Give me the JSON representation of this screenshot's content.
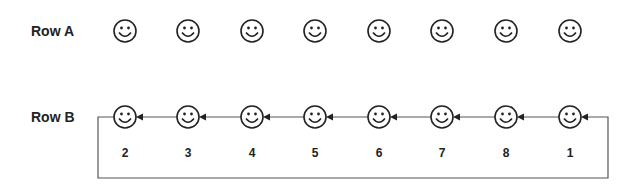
{
  "rows": [
    {
      "label": "Row A",
      "y": 31
    },
    {
      "label": "Row B",
      "y": 117
    }
  ],
  "smiley_x": [
    125,
    188,
    252,
    315,
    379,
    442,
    506,
    570
  ],
  "row_b_numbers": [
    "2",
    "3",
    "4",
    "5",
    "6",
    "7",
    "8",
    "1"
  ],
  "colors": {
    "stroke": "#222222",
    "line": "#555555"
  }
}
